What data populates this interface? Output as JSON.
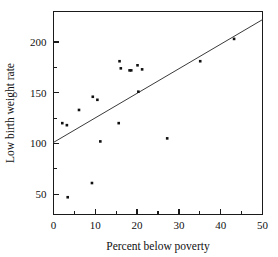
{
  "chart_data": {
    "type": "scatter",
    "title": "",
    "xlabel": "Percent below poverty",
    "ylabel": "Low birth weight rate",
    "xlim": [
      0,
      50
    ],
    "ylim": [
      30,
      230
    ],
    "grid": false,
    "legend": null,
    "x_ticks": [
      0,
      10,
      20,
      30,
      40,
      50
    ],
    "x_tick_labels": [
      "0",
      "10",
      "20",
      "30",
      "40",
      "50"
    ],
    "x_minor_ticks": [
      5,
      15,
      25,
      35,
      45
    ],
    "y_ticks": [
      50,
      100,
      150,
      200
    ],
    "y_tick_labels": [
      "50",
      "100",
      "150",
      "200"
    ],
    "y_minor_ticks": [
      75,
      125,
      175
    ],
    "points": [
      {
        "x": 2.1,
        "y": 120
      },
      {
        "x": 3.2,
        "y": 118
      },
      {
        "x": 3.4,
        "y": 47
      },
      {
        "x": 6.1,
        "y": 133
      },
      {
        "x": 9.2,
        "y": 61
      },
      {
        "x": 9.4,
        "y": 146
      },
      {
        "x": 10.5,
        "y": 143
      },
      {
        "x": 11.2,
        "y": 102
      },
      {
        "x": 15.6,
        "y": 120
      },
      {
        "x": 15.8,
        "y": 181
      },
      {
        "x": 16.1,
        "y": 174
      },
      {
        "x": 18.2,
        "y": 172
      },
      {
        "x": 18.6,
        "y": 172
      },
      {
        "x": 20.1,
        "y": 177
      },
      {
        "x": 20.3,
        "y": 151
      },
      {
        "x": 21.2,
        "y": 173
      },
      {
        "x": 27.2,
        "y": 105
      },
      {
        "x": 35.1,
        "y": 181
      },
      {
        "x": 43.2,
        "y": 203
      }
    ],
    "fit_line": {
      "type": "linear",
      "x_start": 0,
      "y_start": 101,
      "x_end": 50,
      "y_end": 222
    }
  }
}
